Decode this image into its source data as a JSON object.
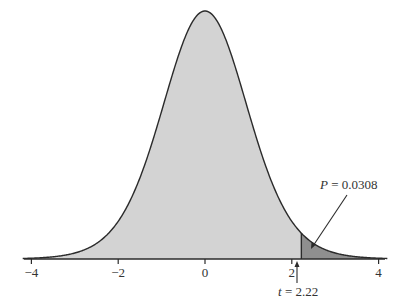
{
  "chart_data": {
    "type": "area",
    "title": "",
    "xlabel": "",
    "ylabel": "",
    "xlim": [
      -4.2,
      4.2
    ],
    "x_ticks": [
      -4,
      -2,
      0,
      2,
      4
    ],
    "x_tick_labels": [
      "−4",
      "−2",
      "0",
      "2",
      "4"
    ],
    "grid": false,
    "legend": null,
    "series": [
      {
        "name": "density",
        "distribution": "t",
        "mean": 0,
        "fill": "#d3d3d3",
        "stroke": "#333333"
      },
      {
        "name": "upper-tail",
        "from": 2.22,
        "to": 4.2,
        "fill": "#8f8f8f"
      }
    ],
    "annotations": [
      {
        "id": "p_value",
        "text_italic": "P",
        "text_rest": " = 0.0308",
        "points_to_x": 2.5
      },
      {
        "id": "t_stat",
        "text_italic": "t",
        "text_rest": " = 2.22",
        "x": 2.22
      }
    ]
  },
  "colors": {
    "curve_fill": "#d3d3d3",
    "tail_fill": "#8f8f8f",
    "stroke": "#2b2b2b"
  }
}
